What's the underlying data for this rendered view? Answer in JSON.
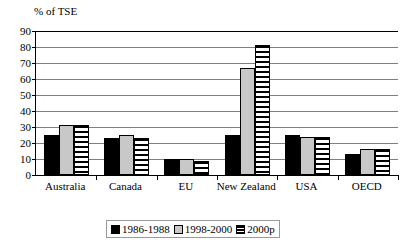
{
  "chart_data": {
    "type": "bar",
    "title": "",
    "ylabel": "% of TSE",
    "xlabel": "",
    "ylim": [
      0,
      90
    ],
    "ytick_step": 10,
    "yticks": [
      0,
      10,
      20,
      30,
      40,
      50,
      60,
      70,
      80,
      90
    ],
    "grid": true,
    "legend_position": "bottom",
    "categories": [
      "Australia",
      "Canada",
      "EU",
      "New Zealand",
      "USA",
      "OECD"
    ],
    "series": [
      {
        "name": "1986-1988",
        "color": "#000000",
        "pattern": "solid-black",
        "values": [
          25,
          23,
          10,
          25,
          25,
          13
        ]
      },
      {
        "name": "1998-2000",
        "color": "#c8c8c8",
        "pattern": "solid-lightgray",
        "values": [
          31,
          25,
          10,
          67,
          24,
          16
        ]
      },
      {
        "name": "2000p",
        "color": "#ffffff",
        "pattern": "horizontal-stripes",
        "values": [
          31,
          23,
          9,
          81,
          24,
          16
        ]
      }
    ]
  },
  "legend": {
    "entries": [
      {
        "label": "1986-1988"
      },
      {
        "label": "1998-2000"
      },
      {
        "label": "2000p"
      }
    ]
  }
}
